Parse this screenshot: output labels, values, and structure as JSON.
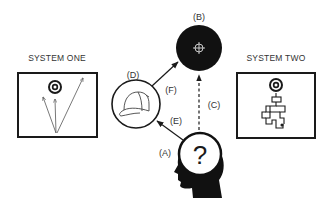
{
  "diagram": {
    "system_one": {
      "title": "SYSTEM ONE",
      "description": "Target with three straight arrows fired from one point"
    },
    "system_two": {
      "title": "SYSTEM TWO",
      "description": "Target reached by a winding maze-like path"
    },
    "nodes": {
      "A": {
        "label": "(A)",
        "description": "Head silhouette with question mark"
      },
      "B": {
        "label": "(B)",
        "description": "Black circle with crosshair target"
      },
      "D": {
        "label": "(D)",
        "description": "Circle containing a baseball cap"
      }
    },
    "edges": {
      "C": {
        "label": "(C)",
        "from": "A",
        "to": "B",
        "style": "dashed"
      },
      "E": {
        "label": "(E)",
        "from": "A",
        "to": "D",
        "style": "solid"
      },
      "F": {
        "label": "(F)",
        "from": "D",
        "to": "B",
        "style": "solid"
      }
    },
    "question_mark": "?"
  },
  "colors": {
    "ink": "#1a1a1a",
    "text": "#333333",
    "background": "#ffffff"
  }
}
